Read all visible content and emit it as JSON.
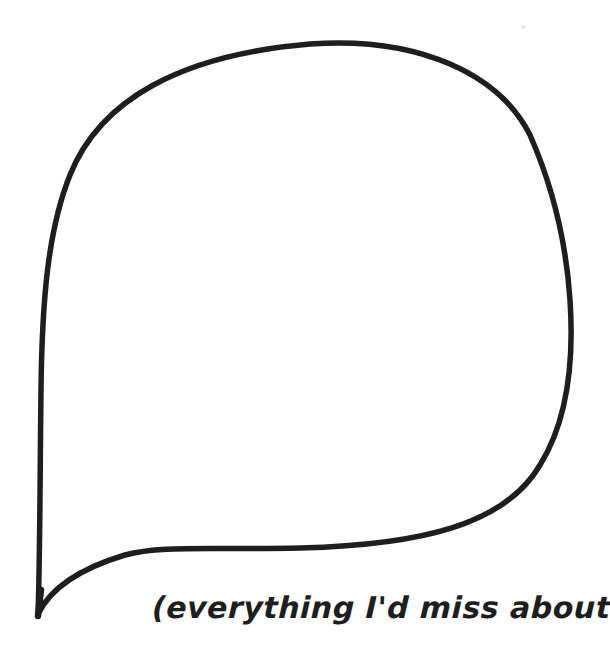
{
  "illustration": {
    "type": "speech-bubble",
    "style": "hand-drawn outline",
    "stroke_color": "#1e1e1e",
    "fill_color": "#ffffff",
    "background_color": "#ffffff",
    "tail_direction": "bottom-left",
    "content": ""
  },
  "caption": {
    "text": "(everything I'd miss about you!)"
  }
}
